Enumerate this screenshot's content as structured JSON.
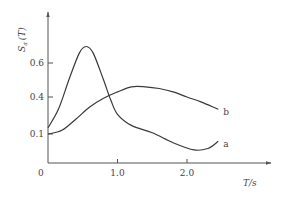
{
  "chart_data": {
    "type": "line",
    "title": "",
    "xlabel": "T/s",
    "ylabel": "Sa(T)",
    "ylabel_main": "S",
    "ylabel_sub": "a",
    "ylabel_rest": "(T)",
    "xlim": [
      0,
      2.9
    ],
    "ylim": [
      0,
      0.8
    ],
    "grid": false,
    "legend": "none (inline labels at curve ends)",
    "x_ticks": [
      {
        "value": 1.0,
        "label": "1.0"
      },
      {
        "value": 2.0,
        "label": "2.0"
      }
    ],
    "y_ticks": [
      {
        "value": 0.1,
        "label": "0.1"
      },
      {
        "value": 0.4,
        "label": "0.4"
      },
      {
        "value": 0.6,
        "label": "0.6"
      }
    ],
    "origin_label": "0",
    "series": [
      {
        "name": "a",
        "x": [
          0,
          0.15,
          0.3,
          0.45,
          0.55,
          0.65,
          0.8,
          0.9,
          1.0,
          1.2,
          1.5,
          1.8,
          2.1,
          2.3,
          2.45
        ],
        "y": [
          0.15,
          0.3,
          0.5,
          0.66,
          0.7,
          0.66,
          0.5,
          0.38,
          0.26,
          0.17,
          0.11,
          0.07,
          0.045,
          0.05,
          0.075
        ]
      },
      {
        "name": "b",
        "x": [
          0,
          0.2,
          0.4,
          0.6,
          0.8,
          1.0,
          1.2,
          1.4,
          1.6,
          1.8,
          2.0,
          2.2,
          2.45
        ],
        "y": [
          0.1,
          0.13,
          0.22,
          0.32,
          0.39,
          0.43,
          0.46,
          0.46,
          0.45,
          0.43,
          0.4,
          0.36,
          0.3
        ]
      }
    ]
  }
}
